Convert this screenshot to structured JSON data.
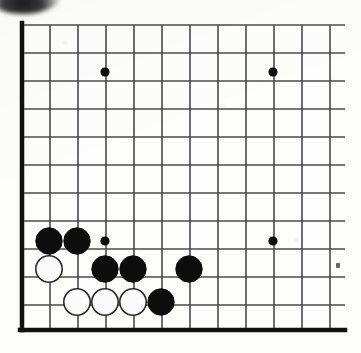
{
  "figure": {
    "kind": "go-board-diagram",
    "width": 361,
    "height": 353,
    "background_color": "#fdfdfc"
  },
  "board": {
    "origin_x": 22,
    "origin_y": 25,
    "spacing": 28,
    "columns_visible": 12,
    "rows_visible": 11,
    "line_color": "#4a4a4a",
    "line_width": 1.6,
    "edge_color": "#111111",
    "edge_width": 4.5,
    "edges": {
      "left": true,
      "top": false,
      "bottom": true,
      "right": false
    },
    "left_edge_x": 22,
    "bottom_edge_y": 330,
    "grid_right_x": 345,
    "grid_top_y": 25
  },
  "star_points": [
    {
      "name": "star-point-top-left",
      "col": 3,
      "row": 2,
      "x": 105,
      "y": 72,
      "radius": 4.6
    },
    {
      "name": "star-point-top-right",
      "col": 9,
      "row": 2,
      "x": 273,
      "y": 72,
      "radius": 4.6
    },
    {
      "name": "star-point-bottom-left",
      "col": 3,
      "row": 8,
      "x": 105,
      "y": 241,
      "radius": 4.6
    },
    {
      "name": "star-point-bottom-right",
      "col": 9,
      "row": 8,
      "x": 273,
      "y": 241,
      "radius": 4.6
    }
  ],
  "stones": {
    "radius": 13.2,
    "black_fill": "#0d0d0d",
    "white_fill": "#fbfbfb",
    "white_stroke": "#2a2a2a",
    "white_stroke_width": 1.6,
    "items": [
      {
        "name": "black-stone-1",
        "color": "black",
        "col": 1,
        "row": 8,
        "x": 49,
        "y": 241
      },
      {
        "name": "black-stone-2",
        "color": "black",
        "col": 2,
        "row": 8,
        "x": 77,
        "y": 241
      },
      {
        "name": "white-stone-1",
        "color": "white",
        "col": 1,
        "row": 9,
        "x": 49,
        "y": 269
      },
      {
        "name": "black-stone-3",
        "color": "black",
        "col": 3,
        "row": 9,
        "x": 105,
        "y": 269
      },
      {
        "name": "black-stone-4",
        "color": "black",
        "col": 4,
        "row": 9,
        "x": 133,
        "y": 269
      },
      {
        "name": "black-stone-5",
        "color": "black",
        "col": 6,
        "row": 9,
        "x": 189,
        "y": 269
      },
      {
        "name": "white-stone-2",
        "color": "white",
        "col": 2,
        "row": 10,
        "x": 77,
        "y": 302
      },
      {
        "name": "white-stone-3",
        "color": "white",
        "col": 3,
        "row": 10,
        "x": 105,
        "y": 302
      },
      {
        "name": "white-stone-4",
        "color": "white",
        "col": 4,
        "row": 10,
        "x": 133,
        "y": 302
      },
      {
        "name": "black-stone-6",
        "color": "black",
        "col": 5,
        "row": 10,
        "x": 161,
        "y": 302
      }
    ]
  },
  "artifacts": [
    {
      "name": "scan-smudge-top-left",
      "x": -14,
      "y": -20
    },
    {
      "name": "scan-speck-right",
      "x": 336,
      "y": 263
    }
  ],
  "counts": {
    "black_stones": "6",
    "white_stones": "4",
    "total_stones": "10"
  }
}
